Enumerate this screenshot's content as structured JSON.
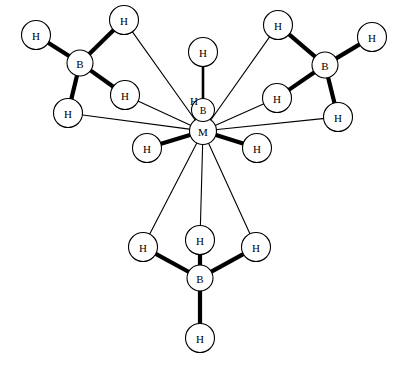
{
  "figure": {
    "background_color": "#ffffff",
    "line_color": "#000000",
    "atom_fill_color": "#ffffff",
    "width": 408,
    "height": 366
  },
  "chart_data": {
    "type": "diagram",
    "xlabel": "",
    "ylabel": "",
    "grid": false,
    "legend": "none",
    "xlim": [
      0,
      408
    ],
    "ylim": [
      0,
      366
    ],
    "atoms": [
      {
        "id": "M",
        "label": "M",
        "x": 203,
        "y": 131,
        "r": 13.5,
        "kind": "metal"
      },
      {
        "id": "Bc",
        "label": "B",
        "x": 203,
        "y": 110,
        "r": 11.5,
        "kind": "boron"
      },
      {
        "id": "Hc1",
        "label": "H",
        "x": 203,
        "y": 52,
        "r": 14.5,
        "kind": "hydrogen"
      },
      {
        "id": "Hc2",
        "label": "H",
        "x": 194,
        "y": 100,
        "r": 0,
        "kind": "hydrogen-label"
      },
      {
        "id": "HmL",
        "label": "H",
        "x": 147,
        "y": 148,
        "r": 14.5,
        "kind": "hydrogen"
      },
      {
        "id": "HmR",
        "label": "H",
        "x": 257,
        "y": 148,
        "r": 14.5,
        "kind": "hydrogen"
      },
      {
        "id": "BL",
        "label": "B",
        "x": 80,
        "y": 63,
        "r": 13.0,
        "kind": "boron"
      },
      {
        "id": "HL1",
        "label": "H",
        "x": 36,
        "y": 35,
        "r": 14.5,
        "kind": "hydrogen"
      },
      {
        "id": "HL2",
        "label": "H",
        "x": 124,
        "y": 20,
        "r": 14.5,
        "kind": "hydrogen"
      },
      {
        "id": "HL3",
        "label": "H",
        "x": 125,
        "y": 95,
        "r": 14.5,
        "kind": "hydrogen"
      },
      {
        "id": "HL4",
        "label": "H",
        "x": 68,
        "y": 113,
        "r": 14.5,
        "kind": "hydrogen"
      },
      {
        "id": "BR",
        "label": "B",
        "x": 325,
        "y": 65,
        "r": 13.0,
        "kind": "boron"
      },
      {
        "id": "HR1",
        "label": "H",
        "x": 278,
        "y": 25,
        "r": 14.5,
        "kind": "hydrogen"
      },
      {
        "id": "HR2",
        "label": "H",
        "x": 372,
        "y": 37,
        "r": 14.5,
        "kind": "hydrogen"
      },
      {
        "id": "HR3",
        "label": "H",
        "x": 277,
        "y": 98,
        "r": 14.5,
        "kind": "hydrogen"
      },
      {
        "id": "HR4",
        "label": "H",
        "x": 338,
        "y": 117,
        "r": 14.5,
        "kind": "hydrogen"
      },
      {
        "id": "BB",
        "label": "B",
        "x": 200,
        "y": 278,
        "r": 13.0,
        "kind": "boron"
      },
      {
        "id": "HB1",
        "label": "H",
        "x": 200,
        "y": 240,
        "r": 14.5,
        "kind": "hydrogen"
      },
      {
        "id": "HB2",
        "label": "H",
        "x": 143,
        "y": 247,
        "r": 14.5,
        "kind": "hydrogen"
      },
      {
        "id": "HB3",
        "label": "H",
        "x": 256,
        "y": 247,
        "r": 14.5,
        "kind": "hydrogen"
      },
      {
        "id": "HB4",
        "label": "H",
        "x": 200,
        "y": 338,
        "r": 14.5,
        "kind": "hydrogen"
      }
    ],
    "bonds": [
      {
        "from": "BL",
        "to": "HL1",
        "style": "thick"
      },
      {
        "from": "BL",
        "to": "HL2",
        "style": "thick"
      },
      {
        "from": "BL",
        "to": "HL3",
        "style": "thick"
      },
      {
        "from": "BL",
        "to": "HL4",
        "style": "thick"
      },
      {
        "from": "BR",
        "to": "HR1",
        "style": "thick"
      },
      {
        "from": "BR",
        "to": "HR2",
        "style": "thick"
      },
      {
        "from": "BR",
        "to": "HR3",
        "style": "thick"
      },
      {
        "from": "BR",
        "to": "HR4",
        "style": "thick"
      },
      {
        "from": "BB",
        "to": "HB1",
        "style": "thick"
      },
      {
        "from": "BB",
        "to": "HB2",
        "style": "thick"
      },
      {
        "from": "BB",
        "to": "HB3",
        "style": "thick"
      },
      {
        "from": "BB",
        "to": "HB4",
        "style": "thick"
      },
      {
        "from": "Bc",
        "to": "Hc1",
        "style": "medium"
      },
      {
        "from": "M",
        "to": "HmL",
        "style": "thick"
      },
      {
        "from": "M",
        "to": "HmR",
        "style": "thick"
      },
      {
        "from": "M",
        "to": "HL2",
        "style": "thin"
      },
      {
        "from": "M",
        "to": "HL3",
        "style": "thin"
      },
      {
        "from": "M",
        "to": "HL4",
        "style": "thin"
      },
      {
        "from": "M",
        "to": "HR1",
        "style": "thin"
      },
      {
        "from": "M",
        "to": "HR3",
        "style": "thin"
      },
      {
        "from": "M",
        "to": "HR4",
        "style": "thin"
      },
      {
        "from": "M",
        "to": "HB1",
        "style": "thin"
      },
      {
        "from": "M",
        "to": "HB2",
        "style": "thin"
      },
      {
        "from": "M",
        "to": "HB3",
        "style": "thin"
      }
    ]
  }
}
